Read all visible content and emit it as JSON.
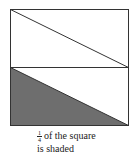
{
  "figure": {
    "shaded_color": "#6e6e6e",
    "stroke_color": "#333333"
  },
  "caption": {
    "fraction_numerator": "1",
    "fraction_denominator": "4",
    "line1_rest": "of the square",
    "line2": "is shaded"
  }
}
